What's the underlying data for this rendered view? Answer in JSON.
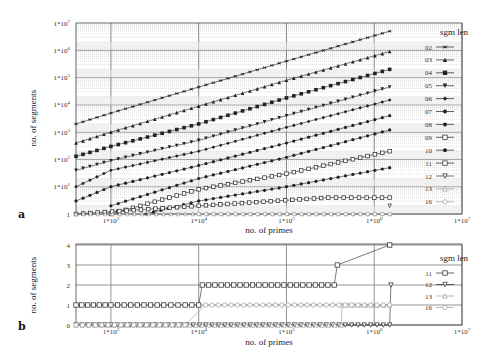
{
  "chart_data": [
    {
      "panel": "a",
      "type": "line",
      "xscale": "log",
      "yscale": "log",
      "xlabel": "no. of primes",
      "ylabel": "no. of segments",
      "xlim": [
        400,
        10000000
      ],
      "ylim": [
        1,
        10000000
      ],
      "x_ticks": [
        "1*10^3",
        "1*10^4",
        "1*10^5",
        "1*10^6",
        "1*10^7"
      ],
      "y_ticks": [
        "1",
        "1*10^1",
        "1*10^2",
        "1*10^3",
        "1*10^4",
        "1*10^5",
        "1*10^6",
        "1*10^7"
      ],
      "grid": true,
      "legend_title": "sgm len",
      "legend_position": "right",
      "series": [
        {
          "name": "02",
          "marker": "asterisk",
          "x": [
            400,
            1000,
            10000,
            100000,
            1500000
          ],
          "values": [
            2000,
            5000,
            45000,
            400000,
            5000000
          ]
        },
        {
          "name": "03",
          "marker": "triangle-up",
          "x": [
            400,
            1000,
            10000,
            100000,
            1500000
          ],
          "values": [
            400,
            1000,
            9000,
            80000,
            900000
          ]
        },
        {
          "name": "04",
          "marker": "square-filled",
          "x": [
            400,
            1000,
            10000,
            100000,
            1500000
          ],
          "values": [
            130,
            300,
            2000,
            18000,
            200000
          ]
        },
        {
          "name": "05",
          "marker": "triangle-down",
          "x": [
            400,
            1000,
            10000,
            100000,
            1500000
          ],
          "values": [
            40,
            90,
            500,
            4000,
            45000
          ]
        },
        {
          "name": "06",
          "marker": "diamond",
          "x": [
            400,
            1000,
            10000,
            100000,
            1500000
          ],
          "values": [
            10,
            40,
            200,
            1500,
            15000
          ]
        },
        {
          "name": "07",
          "marker": "plus-dot",
          "x": [
            400,
            1000,
            10000,
            100000,
            1500000
          ],
          "values": [
            3,
            10,
            60,
            400,
            4000
          ]
        },
        {
          "name": "08",
          "marker": "circle-filled",
          "x": [
            1000,
            10000,
            100000,
            1500000
          ],
          "values": [
            2,
            20,
            120,
            1200
          ]
        },
        {
          "name": "09",
          "marker": "square-cross",
          "x": [
            1000,
            10000,
            100000,
            1500000
          ],
          "values": [
            1,
            8,
            30,
            200
          ]
        },
        {
          "name": "10",
          "marker": "star",
          "x": [
            2500,
            10000,
            100000,
            1500000
          ],
          "values": [
            1,
            3,
            10,
            50
          ]
        },
        {
          "name": "11",
          "marker": "square-open",
          "x": [
            400,
            10000,
            300000,
            1500000
          ],
          "values": [
            1,
            2,
            4,
            4
          ]
        },
        {
          "name": "12",
          "marker": "triangle-down-open",
          "x": [
            1500000
          ],
          "values": [
            2
          ]
        },
        {
          "name": "13",
          "marker": "triangle-up-open",
          "x": [
            400,
            1500000
          ],
          "values": [
            1,
            1
          ]
        },
        {
          "name": "16",
          "marker": "circle-open",
          "x": [
            10000,
            1500000
          ],
          "values": [
            1,
            1
          ]
        }
      ]
    },
    {
      "panel": "b",
      "type": "line",
      "xscale": "log",
      "yscale": "linear",
      "xlabel": "no. of primes",
      "ylabel": "no. of segments",
      "xlim": [
        400,
        10000000
      ],
      "ylim": [
        0,
        4
      ],
      "x_ticks": [
        "1*10^3",
        "1*10^4",
        "1*10^5",
        "1*10^6",
        "1*10^7"
      ],
      "y_ticks": [
        "0",
        "1",
        "2",
        "3",
        "4"
      ],
      "grid": true,
      "legend_title": "sgm len",
      "legend_position": "right",
      "series": [
        {
          "name": "11",
          "marker": "square-open",
          "x": [
            400,
            1000,
            2000,
            4000,
            7000,
            10000,
            11000,
            350000,
            380000,
            1500000
          ],
          "values": [
            1,
            1,
            1,
            1,
            1,
            1,
            2,
            2,
            3,
            4
          ]
        },
        {
          "name": "12",
          "marker": "triangle-down-open",
          "x": [
            400,
            1000,
            1500000,
            1550000
          ],
          "values": [
            0,
            0,
            0,
            2
          ]
        },
        {
          "name": "13",
          "marker": "triangle-up-open",
          "x": [
            400,
            420000,
            430000,
            1500000
          ],
          "values": [
            0,
            0,
            1,
            1
          ]
        },
        {
          "name": "16",
          "marker": "circle-open",
          "x": [
            400,
            7000,
            12000,
            1500000
          ],
          "values": [
            0,
            0,
            1,
            1
          ]
        }
      ]
    }
  ],
  "panels": {
    "a": {
      "label": "a",
      "ylabel": "no. of segments",
      "xlabel": "no. of primes",
      "legend_title": "sgm len",
      "legend": [
        "02",
        "03",
        "04",
        "05",
        "06",
        "07",
        "08",
        "09",
        "10",
        "11",
        "12",
        "13",
        "16"
      ],
      "yticks": [
        "1",
        "1*10",
        "1*10",
        "1*10",
        "1*10",
        "1*10",
        "1*10",
        "1*10"
      ],
      "ytick_exp": [
        "",
        "1",
        "2",
        "3",
        "4",
        "5",
        "6",
        "7"
      ],
      "xticks": [
        "1*10",
        "1*10",
        "1*10",
        "1*10",
        "1*10"
      ],
      "xtick_exp": [
        "3",
        "4",
        "5",
        "6",
        "7"
      ]
    },
    "b": {
      "label": "b",
      "ylabel": "no. of segments",
      "xlabel": "no. of primes",
      "legend_title": "sgm len",
      "legend": [
        "11",
        "12",
        "13",
        "16"
      ],
      "yticks": [
        "0",
        "1",
        "2",
        "3",
        "4"
      ],
      "xticks": [
        "1*10",
        "1*10",
        "1*10",
        "1*10",
        "1*10"
      ],
      "xtick_exp": [
        "3",
        "4",
        "5",
        "6",
        "7"
      ]
    }
  }
}
